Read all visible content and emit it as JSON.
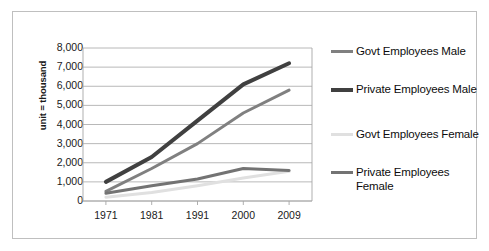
{
  "chart_data": {
    "type": "line",
    "title": "",
    "xlabel": "",
    "ylabel": "unit = thousand",
    "categories": [
      "1971",
      "1981",
      "1991",
      "2000",
      "2009"
    ],
    "ylim": [
      0,
      8000
    ],
    "ytick_labels": [
      "8,000",
      "7,000",
      "6,000",
      "5,000",
      "4,000",
      "3,000",
      "2,000",
      "1,000",
      "0"
    ],
    "ytick_values": [
      8000,
      7000,
      6000,
      5000,
      4000,
      3000,
      2000,
      1000,
      0
    ],
    "grid": "horizontal",
    "legend_position": "right",
    "series": [
      {
        "name": "Govt Employees Male",
        "color": "#808080",
        "width": 3,
        "values": [
          500,
          1700,
          3000,
          4600,
          5800
        ]
      },
      {
        "name": "Private Employees Male",
        "color": "#404040",
        "width": 4,
        "values": [
          1000,
          2300,
          4200,
          6100,
          7200
        ]
      },
      {
        "name": "Govt Employees Female",
        "color": "#e0e0e0",
        "width": 3,
        "values": [
          200,
          450,
          800,
          1200,
          1550
        ]
      },
      {
        "name": "Private Employees Female",
        "color": "#737373",
        "width": 3,
        "values": [
          400,
          800,
          1150,
          1700,
          1600
        ]
      }
    ]
  },
  "legend": {
    "entries": [
      {
        "label": "Govt Employees Male"
      },
      {
        "label": "Private Employees Male"
      },
      {
        "label": "Govt Employees Female"
      },
      {
        "label": "Private Employees Female"
      }
    ]
  },
  "colors": {
    "frame_border": "#bfbfbf",
    "grid_line": "#a6a6a6",
    "axis_line": "#a6a6a6",
    "text": "#1a1a1a",
    "background": "#ffffff"
  }
}
